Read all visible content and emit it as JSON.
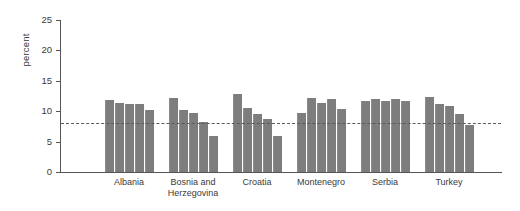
{
  "chart_data": {
    "type": "bar",
    "title": "",
    "subtitle": "",
    "xlabel": "",
    "ylabel": "percent",
    "ylim": [
      0,
      25
    ],
    "yticks": [
      0,
      5,
      10,
      15,
      20,
      25
    ],
    "ytick_labels": [
      "0",
      "5",
      "10",
      "15",
      "20",
      "25"
    ],
    "grid": false,
    "legend": "none",
    "bar_color": "#7d7d7d",
    "reference_line": {
      "label": "",
      "value": 8.0,
      "style": "dashed",
      "color": "#5a5a5a"
    },
    "categories": [
      "Albania",
      "Bosnia and\nHerzegovina",
      "Croatia",
      "Montenegro",
      "Serbia",
      "Turkey"
    ],
    "groups": [
      {
        "name": "Albania",
        "values": [
          11.8,
          11.4,
          11.2,
          11.2,
          10.2
        ]
      },
      {
        "name": "Bosnia and Herzegovina",
        "values": [
          12.2,
          10.2,
          9.7,
          8.2,
          6.0
        ]
      },
      {
        "name": "Croatia",
        "values": [
          12.9,
          10.6,
          9.6,
          8.8,
          6.0
        ]
      },
      {
        "name": "Montenegro",
        "values": [
          9.7,
          12.2,
          11.4,
          12.0,
          10.3
        ]
      },
      {
        "name": "Serbia",
        "values": [
          11.7,
          12.0,
          11.7,
          12.0,
          11.6
        ]
      },
      {
        "name": "Turkey",
        "values": [
          12.3,
          11.2,
          10.9,
          9.6,
          7.8
        ]
      }
    ]
  }
}
